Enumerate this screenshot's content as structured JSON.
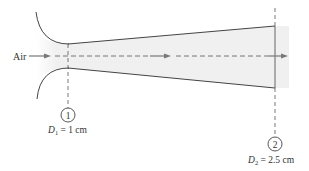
{
  "diagram": {
    "title": "",
    "flow_label": "Air",
    "sections": [
      {
        "id": "1",
        "marker": "1",
        "label_var": "D",
        "label_sub": "1",
        "label_rest": " = 1 cm"
      },
      {
        "id": "2",
        "marker": "2",
        "label_var": "D",
        "label_sub": "2",
        "label_rest": " = 2.5 cm"
      }
    ],
    "colors": {
      "line": "#444444",
      "shade": "#f0f0f0",
      "arrow": "#777777",
      "text": "#333333"
    }
  }
}
